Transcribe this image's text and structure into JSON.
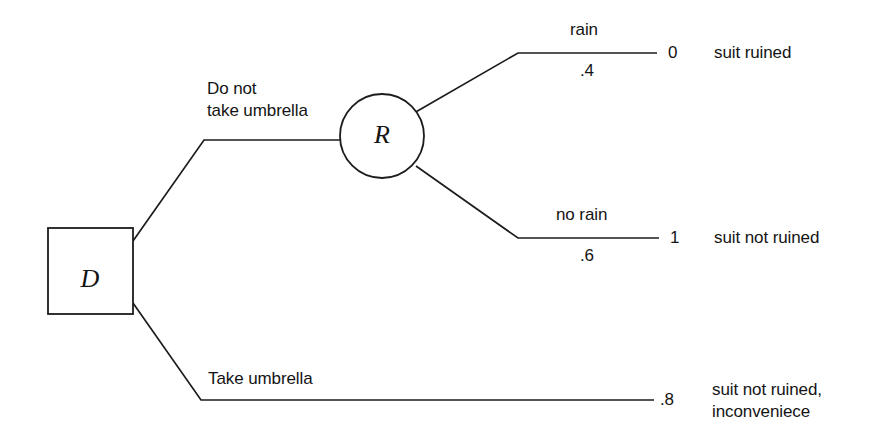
{
  "diagram": {
    "type": "decision-tree",
    "title_visible": false,
    "background_color": "#ffffff",
    "line_color": "#1c1c1c",
    "text_color": "#141414",
    "nodes": [
      {
        "id": "D",
        "label": "D",
        "shape": "square",
        "kind": "decision"
      },
      {
        "id": "R",
        "label": "R",
        "shape": "circle",
        "kind": "chance"
      }
    ],
    "branches": [
      {
        "id": "do-not-take-umbrella",
        "from": "D",
        "to": "R",
        "label": "Do not",
        "label_line2": "take umbrella"
      },
      {
        "id": "take-umbrella",
        "from": "D",
        "to": "outcome-take-umbrella",
        "label": "Take umbrella"
      },
      {
        "id": "rain",
        "from": "R",
        "to": "outcome-rain",
        "label": "rain",
        "probability": ".4"
      },
      {
        "id": "no-rain",
        "from": "R",
        "to": "outcome-no-rain",
        "label": "no rain",
        "probability": ".6"
      }
    ],
    "outcomes": [
      {
        "id": "outcome-rain",
        "value": "0",
        "description": "suit ruined"
      },
      {
        "id": "outcome-no-rain",
        "value": "1",
        "description": "suit not ruined"
      },
      {
        "id": "outcome-take-umbrella",
        "value": ".8",
        "description": "suit not ruined,",
        "description_line2": "inconveniece"
      }
    ]
  }
}
